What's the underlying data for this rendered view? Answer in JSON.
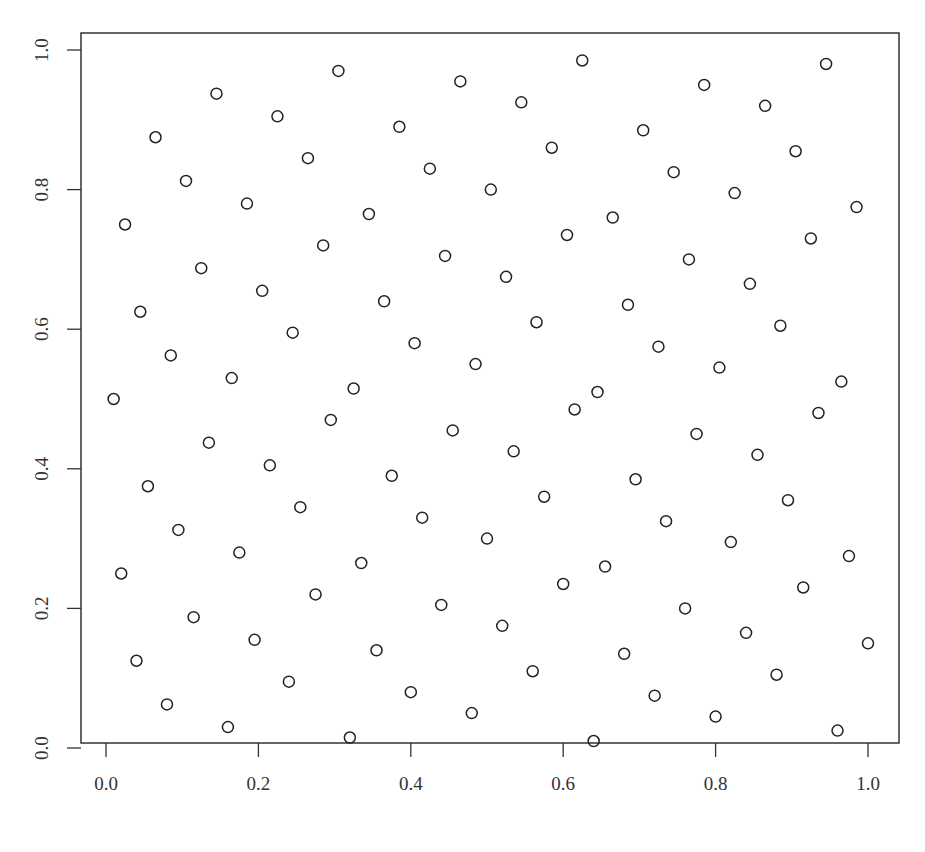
{
  "chart_data": {
    "type": "scatter",
    "title": "",
    "xlabel": "",
    "ylabel": "",
    "xlim": [
      0,
      1
    ],
    "ylim": [
      0,
      1
    ],
    "grid": false,
    "marker": "open-circle",
    "x_ticks": [
      "0.0",
      "0.2",
      "0.4",
      "0.6",
      "0.8",
      "1.0"
    ],
    "y_ticks": [
      "0.0",
      "0.2",
      "0.4",
      "0.6",
      "0.8",
      "1.0"
    ],
    "points": [
      [
        0.01,
        0.5
      ],
      [
        0.02,
        0.25
      ],
      [
        0.025,
        0.75
      ],
      [
        0.04,
        0.125
      ],
      [
        0.045,
        0.625
      ],
      [
        0.055,
        0.375
      ],
      [
        0.065,
        0.875
      ],
      [
        0.08,
        0.0625
      ],
      [
        0.085,
        0.5625
      ],
      [
        0.095,
        0.3125
      ],
      [
        0.105,
        0.8125
      ],
      [
        0.115,
        0.1875
      ],
      [
        0.125,
        0.6875
      ],
      [
        0.135,
        0.4375
      ],
      [
        0.145,
        0.9375
      ],
      [
        0.16,
        0.03
      ],
      [
        0.165,
        0.53
      ],
      [
        0.175,
        0.28
      ],
      [
        0.185,
        0.78
      ],
      [
        0.195,
        0.155
      ],
      [
        0.205,
        0.655
      ],
      [
        0.215,
        0.405
      ],
      [
        0.225,
        0.905
      ],
      [
        0.24,
        0.095
      ],
      [
        0.245,
        0.595
      ],
      [
        0.255,
        0.345
      ],
      [
        0.265,
        0.845
      ],
      [
        0.275,
        0.22
      ],
      [
        0.285,
        0.72
      ],
      [
        0.295,
        0.47
      ],
      [
        0.305,
        0.97
      ],
      [
        0.32,
        0.015
      ],
      [
        0.325,
        0.515
      ],
      [
        0.335,
        0.265
      ],
      [
        0.345,
        0.765
      ],
      [
        0.355,
        0.14
      ],
      [
        0.365,
        0.64
      ],
      [
        0.375,
        0.39
      ],
      [
        0.385,
        0.89
      ],
      [
        0.4,
        0.08
      ],
      [
        0.405,
        0.58
      ],
      [
        0.415,
        0.33
      ],
      [
        0.425,
        0.83
      ],
      [
        0.44,
        0.205
      ],
      [
        0.445,
        0.705
      ],
      [
        0.455,
        0.455
      ],
      [
        0.465,
        0.955
      ],
      [
        0.48,
        0.05
      ],
      [
        0.485,
        0.55
      ],
      [
        0.5,
        0.3
      ],
      [
        0.505,
        0.8
      ],
      [
        0.52,
        0.175
      ],
      [
        0.525,
        0.675
      ],
      [
        0.535,
        0.425
      ],
      [
        0.545,
        0.925
      ],
      [
        0.56,
        0.11
      ],
      [
        0.565,
        0.61
      ],
      [
        0.575,
        0.36
      ],
      [
        0.585,
        0.86
      ],
      [
        0.6,
        0.235
      ],
      [
        0.605,
        0.735
      ],
      [
        0.615,
        0.485
      ],
      [
        0.625,
        0.985
      ],
      [
        0.64,
        0.01
      ],
      [
        0.645,
        0.51
      ],
      [
        0.655,
        0.26
      ],
      [
        0.665,
        0.76
      ],
      [
        0.68,
        0.135
      ],
      [
        0.685,
        0.635
      ],
      [
        0.695,
        0.385
      ],
      [
        0.705,
        0.885
      ],
      [
        0.72,
        0.075
      ],
      [
        0.725,
        0.575
      ],
      [
        0.735,
        0.325
      ],
      [
        0.745,
        0.825
      ],
      [
        0.76,
        0.2
      ],
      [
        0.765,
        0.7
      ],
      [
        0.775,
        0.45
      ],
      [
        0.785,
        0.95
      ],
      [
        0.8,
        0.045
      ],
      [
        0.805,
        0.545
      ],
      [
        0.82,
        0.295
      ],
      [
        0.825,
        0.795
      ],
      [
        0.84,
        0.165
      ],
      [
        0.845,
        0.665
      ],
      [
        0.855,
        0.42
      ],
      [
        0.865,
        0.92
      ],
      [
        0.88,
        0.105
      ],
      [
        0.885,
        0.605
      ],
      [
        0.895,
        0.355
      ],
      [
        0.905,
        0.855
      ],
      [
        0.915,
        0.23
      ],
      [
        0.925,
        0.73
      ],
      [
        0.935,
        0.48
      ],
      [
        0.945,
        0.98
      ],
      [
        0.96,
        0.025
      ],
      [
        0.965,
        0.525
      ],
      [
        0.975,
        0.275
      ],
      [
        0.985,
        0.775
      ],
      [
        1.0,
        0.15
      ]
    ]
  }
}
